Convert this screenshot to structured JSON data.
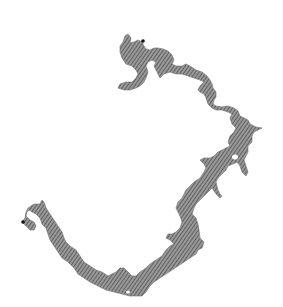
{
  "map": {
    "width": 283,
    "height": 307,
    "background": "#ffffff",
    "water_fill": "#8a8a8a",
    "hatch_color": "#4a4a4a",
    "outline_color": "#6e6e6e",
    "markers": [
      {
        "name": "upstream-end",
        "x": 143,
        "y": 41,
        "color": "#111111"
      },
      {
        "name": "downstream-end",
        "x": 23,
        "y": 222,
        "color": "#111111"
      }
    ]
  }
}
